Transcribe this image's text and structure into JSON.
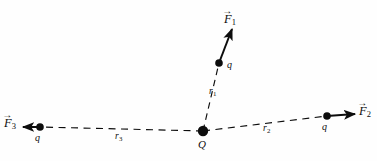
{
  "figure": {
    "background_color": "#fefefe",
    "stroke_color": "#0d0d0d",
    "center_charge": {
      "symbol": "Q",
      "x": 203,
      "y": 131,
      "radius": 5.2
    },
    "charges": [
      {
        "id": "charge-1",
        "symbol": "q",
        "x": 219,
        "y": 63,
        "radius": 3.8
      },
      {
        "id": "charge-2",
        "symbol": "q",
        "x": 327,
        "y": 116,
        "radius": 3.8
      },
      {
        "id": "charge-3",
        "symbol": "q",
        "x": 40,
        "y": 127,
        "radius": 3.8
      }
    ],
    "distances": [
      {
        "id": "r1",
        "label": "r",
        "subscript": "1",
        "x": 209,
        "y": 92
      },
      {
        "id": "r2",
        "label": "r",
        "subscript": "2",
        "x": 266,
        "y": 128
      },
      {
        "id": "r3",
        "label": "r",
        "subscript": "3",
        "x": 118,
        "y": 136
      }
    ],
    "forces": [
      {
        "id": "F1",
        "label": "F",
        "subscript": "1",
        "arrow_glyph": "→",
        "label_x": 224,
        "label_y": 12,
        "from_x": 219,
        "from_y": 63,
        "to_x": 232,
        "to_y": 28
      },
      {
        "id": "F2",
        "label": "F",
        "subscript": "2",
        "arrow_glyph": "→",
        "label_x": 359,
        "label_y": 104,
        "from_x": 327,
        "from_y": 116,
        "to_x": 357,
        "to_y": 114
      },
      {
        "id": "F3",
        "label": "F",
        "subscript": "3",
        "arrow_glyph": "→",
        "label_x": 4,
        "label_y": 116,
        "from_x": 40,
        "from_y": 127,
        "to_x": 21,
        "to_y": 127
      }
    ]
  }
}
